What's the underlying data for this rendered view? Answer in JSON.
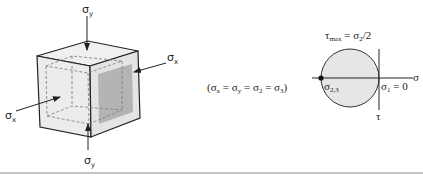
{
  "cube_labels": {
    "sigma_y_top": "σ",
    "sigma_y_top_sub": "y",
    "sigma_y_bottom": "σ",
    "sigma_y_bottom_sub": "y",
    "sigma_x_left": "σ",
    "sigma_x_left_sub": "x",
    "sigma_x_right": "σ",
    "sigma_x_right_sub": "x"
  },
  "equation": {
    "open": "(σ",
    "x": "x",
    "eq1": " = σ",
    "y": "y",
    "eq2": " = σ",
    "two": "2",
    "eq3": " = σ",
    "three": "3",
    "close": ")"
  },
  "mohr": {
    "tau_max": "τ",
    "tau_max_sub": "max",
    "tau_max_rhs": " = σ",
    "tau_max_rhs_sub": "2",
    "tau_max_rhs_end": "/2",
    "sigma_axis": "σ",
    "tau_axis": "τ",
    "sigma23": "σ",
    "sigma23_sub": "2,3",
    "sigma1": "σ",
    "sigma1_sub": "1",
    "sigma1_rhs": " = 0"
  },
  "colors": {
    "cube_face": "#ececec",
    "cube_shade": "#b4b4b4",
    "circle_fill": "#e6e6e6",
    "line": "#222222",
    "rule": "#8a8a8a"
  }
}
